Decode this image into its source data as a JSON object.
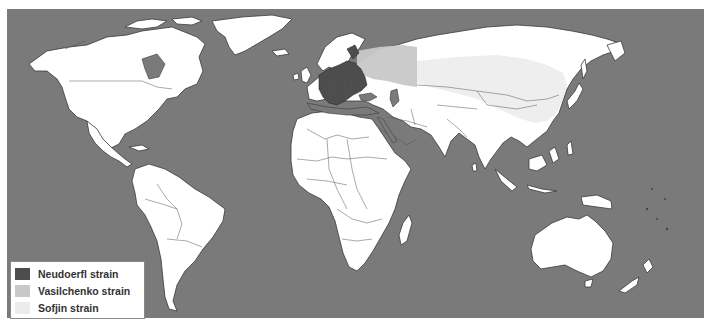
{
  "map": {
    "title": "",
    "ocean_color": "#7a7a7a",
    "land_color": "#ffffff",
    "border_color": "#3a3a3a"
  },
  "legend": {
    "items": [
      {
        "label": "Neudoerfl strain",
        "color": "#4d4d4d"
      },
      {
        "label": "Vasilchenko strain",
        "color": "#c8c8c8"
      },
      {
        "label": "Sofjin strain",
        "color": "#ececec"
      }
    ]
  },
  "regions": {
    "neudoerfl": "Central and Eastern Europe",
    "vasilchenko": "Western Russia / Western Siberia",
    "sofjin": "Eastern Siberia, Mongolia, Northern China, Russian Far East"
  }
}
